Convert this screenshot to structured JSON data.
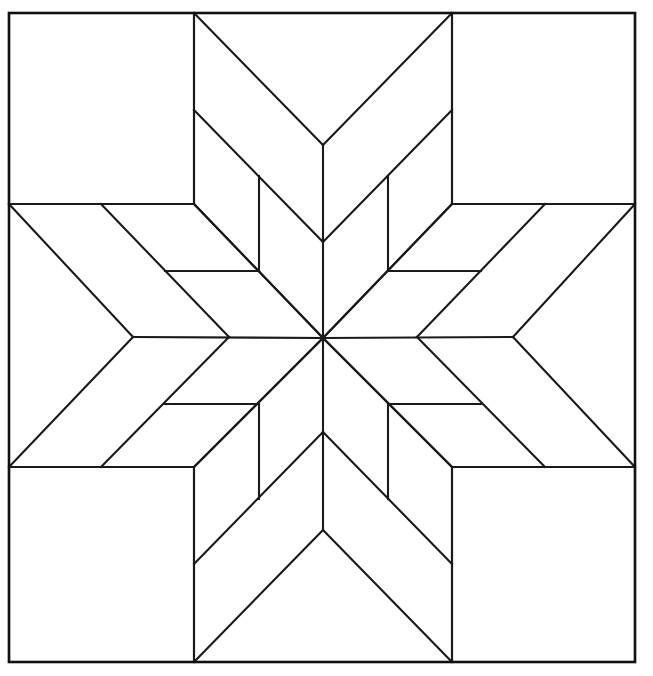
{
  "document": {
    "title": "Eight-Pointed Star Quilt Block Coloring Page",
    "kind": "line-art-diagram",
    "background_color": "#ffffff",
    "line_color": "#1a1a1a",
    "fill_color": "#ffffff",
    "canvas": {
      "width": 653,
      "height": 676
    }
  },
  "frame": {
    "name": "outer-border",
    "left": 9,
    "top": 13,
    "right": 635,
    "bottom": 662,
    "stroke_width": 2.6
  },
  "geometry": {
    "center": {
      "x": 323,
      "y": 338
    },
    "notch_radius_axis": 190,
    "notch_radius_diagonal": 190,
    "tip_radius_axis": 325,
    "arm_half_width": 130,
    "points": 8,
    "divisions_per_point": 4,
    "corner_square_inset": {
      "x": 194,
      "y": 204
    }
  },
  "chart_data": {
    "type": "diagram",
    "symmetry": "8-fold dihedral (D8)",
    "element_counts": {
      "star_points": 8,
      "sub_diamonds_per_point": 4,
      "total_sub_diamonds": 32,
      "corner_squares": 4,
      "side_background_pieces": 4,
      "outer_border": 1
    },
    "star_point_directions": [
      "up",
      "up-right",
      "right",
      "down-right",
      "down",
      "down-left",
      "left",
      "up-left"
    ],
    "legend": [],
    "axis": {
      "visible": false
    },
    "grid": false
  },
  "pieces": {
    "star_point_label": "star-point",
    "sub_diamond_label": "sub-diamond",
    "corner_square_label": "corner-square",
    "background_label": "background-piece"
  }
}
